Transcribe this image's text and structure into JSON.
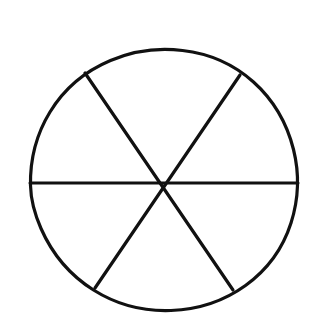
{
  "figure": {
    "title": "Circle divided into six equal sectors",
    "background_color": "#ffffff",
    "stroke_color": "#111111",
    "stroke_width": 3.2,
    "canvas": {
      "width": 314,
      "height": 329
    }
  },
  "chart_data": {
    "type": "pie",
    "title": "Circle divided into six equal sectors",
    "subtitle": "",
    "xlabel": "",
    "ylabel": "",
    "categories": [
      "sector-1-upper-right",
      "sector-2-right",
      "sector-3-lower-right",
      "sector-4-lower-left",
      "sector-5-left",
      "sector-6-upper-left"
    ],
    "values": [
      1,
      1,
      1,
      1,
      1,
      1
    ],
    "fractions": [
      "1/6",
      "1/6",
      "1/6",
      "1/6",
      "1/6",
      "1/6"
    ],
    "percentages": [
      16.67,
      16.67,
      16.67,
      16.67,
      16.67,
      16.67
    ],
    "slice_angle_degrees": 60,
    "total_slices": 6,
    "shaded_slices": 0,
    "unshaded_slices": 6,
    "slice_fill": "#ffffff",
    "slice_stroke": "#111111",
    "legend": [],
    "legend_position": "none",
    "grid": false,
    "data_labels": false,
    "start_angle_degrees": 0,
    "rotation_note": "One diameter is horizontal; the two other diameters sit at about +60 and -60 degrees from horizontal."
  },
  "geometry": {
    "center": {
      "x": 164,
      "y": 183
    },
    "radius_x": 134,
    "radius_y": 133,
    "bounds": {
      "left": 30,
      "top": 50,
      "right": 298,
      "bottom": 311
    },
    "diameters": [
      {
        "name": "horizontal-diameter",
        "angle_degrees": 0,
        "from": {
          "x": 30,
          "y": 183
        },
        "to": {
          "x": 298,
          "y": 183
        }
      },
      {
        "name": "diagonal-diameter-nw-se",
        "angle_degrees": -61,
        "from": {
          "x": 85,
          "y": 73
        },
        "to": {
          "x": 233,
          "y": 290
        }
      },
      {
        "name": "diagonal-diameter-ne-sw",
        "angle_degrees": 61,
        "from": {
          "x": 240,
          "y": 75
        },
        "to": {
          "x": 95,
          "y": 288
        }
      }
    ],
    "circle_path": "M 30.5 185.5 C 30.0 160.0 36.5 134.0 50.0 112.0 C 64.0 89.0 85.5 71.0 110.5 60.5 C 133.0 51.0 158.5 47.5 182.5 50.5 C 209.0 53.5 234.0 64.5 253.5 82.0 C 273.0 99.5 287.0 123.5 293.5 149.5 C 299.5 173.5 298.5 199.5 291.0 223.0 C 283.0 248.0 267.0 270.0 245.5 285.5 C 224.0 301.0 197.5 309.5 171.0 310.5 C 144.0 311.5 116.5 304.5 93.5 290.0 C 70.5 275.5 52.0 253.5 41.0 228.5 C 34.0 212.5 30.8 199.0 30.5 185.5 Z"
  }
}
